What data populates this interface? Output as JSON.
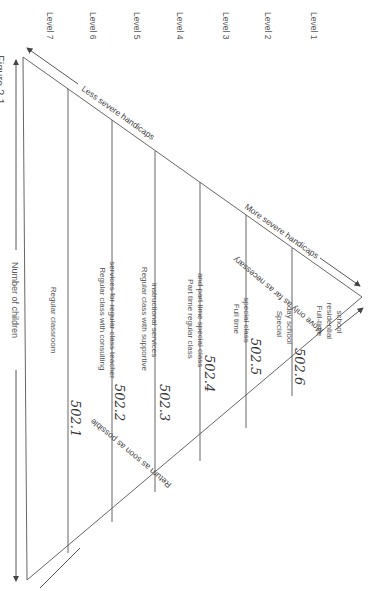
{
  "figure": {
    "caption_fragment": "Figure 2.1",
    "axis_label": "Number of children"
  },
  "levels": [
    {
      "label": "Level 1",
      "setting": [
        "Full-time",
        "residential",
        "school"
      ],
      "code": "502.6"
    },
    {
      "label": "Level 2",
      "setting": [
        "Special",
        "day school"
      ],
      "code": "502.5"
    },
    {
      "label": "Level 3",
      "setting": [
        "Full time",
        "special class"
      ],
      "code": "502.4"
    },
    {
      "label": "Level 4",
      "setting": [
        "Part time regular class",
        "and part time special class"
      ],
      "code": "502.3"
    },
    {
      "label": "Level 5",
      "setting": [
        "Regular class with supportive",
        "instructional services"
      ],
      "code": "502.2"
    },
    {
      "label": "Level 6",
      "setting": [
        "Regular class with consulting",
        "services for regular class teacher"
      ],
      "code": "502.1"
    },
    {
      "label": "Level 7",
      "setting": [
        "Regular classroom"
      ],
      "code": ""
    }
  ],
  "edges": {
    "top_left": "Less severe handicaps",
    "top_right": "More severe handicaps",
    "bottom_right": "Move only as far as necessary",
    "bottom_left": "Return as soon as possible"
  },
  "colors": {
    "line": "#555555",
    "text": "#555555",
    "handwriting": "#333333"
  }
}
